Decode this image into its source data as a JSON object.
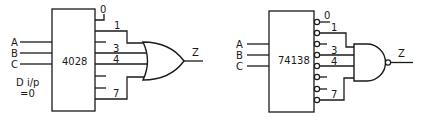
{
  "left_circuit": {
    "decoder_label": "4028",
    "inputs": [
      {
        "label": "A",
        "y": 42
      },
      {
        "label": "B",
        "y": 53
      },
      {
        "label": "C",
        "y": 64
      }
    ],
    "note_line1": "D i/p",
    "note_line2": "=0",
    "outputs": {
      "label_0": "0",
      "label_1": "1",
      "label_3": "3",
      "label_4": "4",
      "label_7": "7"
    },
    "gate_type": "OR",
    "output_label": "Z"
  },
  "right_circuit": {
    "decoder_label": "74138",
    "inputs": [
      {
        "label": "A",
        "y": 44
      },
      {
        "label": "B",
        "y": 55
      },
      {
        "label": "C",
        "y": 66
      }
    ],
    "outputs": {
      "label_0": "0",
      "label_1": "1",
      "label_3": "3",
      "label_4": "4",
      "label_7": "7"
    },
    "gate_type": "NAND",
    "output_label": "Z"
  }
}
